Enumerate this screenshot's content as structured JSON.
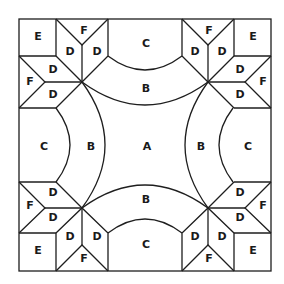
{
  "diagram": {
    "line_color": "#1e1e1e",
    "background": "#ffffff",
    "labels": {
      "center": "A",
      "arc_inner": "B",
      "arc_outer": "C",
      "star_diamond": "D",
      "corner_square": "E",
      "edge_triangle": "F"
    },
    "pieces": [
      {
        "id": "A",
        "text": "A",
        "x": 147,
        "y": 146
      },
      {
        "id": "B-top",
        "text": "B",
        "x": 146,
        "y": 88
      },
      {
        "id": "B-bottom",
        "text": "B",
        "x": 146,
        "y": 199
      },
      {
        "id": "B-left",
        "text": "B",
        "x": 91,
        "y": 146
      },
      {
        "id": "B-right",
        "text": "B",
        "x": 201,
        "y": 146
      },
      {
        "id": "C-top",
        "text": "C",
        "x": 146,
        "y": 43
      },
      {
        "id": "C-bottom",
        "text": "C",
        "x": 146,
        "y": 244
      },
      {
        "id": "C-left",
        "text": "C",
        "x": 44,
        "y": 146
      },
      {
        "id": "C-right",
        "text": "C",
        "x": 248,
        "y": 146
      },
      {
        "id": "E-tl",
        "text": "E",
        "x": 38,
        "y": 36
      },
      {
        "id": "E-tr",
        "text": "E",
        "x": 253,
        "y": 36
      },
      {
        "id": "E-bl",
        "text": "E",
        "x": 38,
        "y": 250
      },
      {
        "id": "E-br",
        "text": "E",
        "x": 253,
        "y": 250
      },
      {
        "id": "F-tl-top",
        "text": "F",
        "x": 84,
        "y": 30
      },
      {
        "id": "F-tl-left",
        "text": "F",
        "x": 30,
        "y": 81
      },
      {
        "id": "F-tr-top",
        "text": "F",
        "x": 209,
        "y": 30
      },
      {
        "id": "F-tr-right",
        "text": "F",
        "x": 263,
        "y": 81
      },
      {
        "id": "F-bl-left",
        "text": "F",
        "x": 30,
        "y": 205
      },
      {
        "id": "F-bl-bottom",
        "text": "F",
        "x": 84,
        "y": 258
      },
      {
        "id": "F-br-right",
        "text": "F",
        "x": 263,
        "y": 205
      },
      {
        "id": "F-br-bottom",
        "text": "F",
        "x": 209,
        "y": 258
      },
      {
        "id": "D-tl-1",
        "text": "D",
        "x": 70,
        "y": 51
      },
      {
        "id": "D-tl-2",
        "text": "D",
        "x": 97,
        "y": 51
      },
      {
        "id": "D-tl-3",
        "text": "D",
        "x": 53,
        "y": 69
      },
      {
        "id": "D-tl-4",
        "text": "D",
        "x": 53,
        "y": 94
      },
      {
        "id": "D-tr-1",
        "text": "D",
        "x": 195,
        "y": 51
      },
      {
        "id": "D-tr-2",
        "text": "D",
        "x": 222,
        "y": 51
      },
      {
        "id": "D-tr-3",
        "text": "D",
        "x": 240,
        "y": 69
      },
      {
        "id": "D-tr-4",
        "text": "D",
        "x": 240,
        "y": 94
      },
      {
        "id": "D-bl-1",
        "text": "D",
        "x": 53,
        "y": 192
      },
      {
        "id": "D-bl-2",
        "text": "D",
        "x": 53,
        "y": 217
      },
      {
        "id": "D-bl-3",
        "text": "D",
        "x": 70,
        "y": 236
      },
      {
        "id": "D-bl-4",
        "text": "D",
        "x": 97,
        "y": 236
      },
      {
        "id": "D-br-1",
        "text": "D",
        "x": 240,
        "y": 192
      },
      {
        "id": "D-br-2",
        "text": "D",
        "x": 240,
        "y": 217
      },
      {
        "id": "D-br-3",
        "text": "D",
        "x": 195,
        "y": 236
      },
      {
        "id": "D-br-4",
        "text": "D",
        "x": 222,
        "y": 236
      }
    ]
  }
}
